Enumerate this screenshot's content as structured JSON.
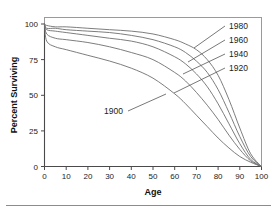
{
  "figure": {
    "background_color": "#ffffff",
    "frame_color": "#9a9a9a",
    "curve_color": "#6e6e6e",
    "axis_color": "#4a4a4a",
    "footer_fragment": ""
  },
  "chart_data": {
    "type": "line",
    "title": "",
    "xlabel": "Age",
    "ylabel": "Percent Surviving",
    "xlim": [
      0,
      100
    ],
    "ylim": [
      0,
      100
    ],
    "xticks": [
      0,
      10,
      20,
      30,
      40,
      50,
      60,
      70,
      80,
      90,
      100
    ],
    "xticklabels": [
      "0",
      "10",
      "20",
      "30",
      "40",
      "50",
      "60",
      "70",
      "80",
      "90",
      "100"
    ],
    "yticks": [
      0,
      25,
      50,
      75,
      100
    ],
    "yticklabels": [
      "0",
      "25",
      "50",
      "75",
      "100"
    ],
    "grid": false,
    "legend_position": "inline-annotations",
    "x": [
      0,
      1,
      5,
      10,
      20,
      30,
      40,
      50,
      60,
      65,
      70,
      75,
      80,
      85,
      90,
      95,
      100
    ],
    "series": [
      {
        "name": "1900",
        "label": "1900",
        "values": [
          100,
          88,
          84,
          82,
          78,
          74,
          69,
          62,
          51,
          44,
          36,
          28,
          20,
          13,
          7,
          3,
          0
        ]
      },
      {
        "name": "1920",
        "label": "1920",
        "values": [
          100,
          93,
          90,
          89,
          87,
          84,
          80,
          75,
          66,
          60,
          52,
          43,
          33,
          22,
          12,
          4,
          0
        ]
      },
      {
        "name": "1940",
        "label": "1940",
        "values": [
          100,
          96,
          95,
          94,
          92,
          90,
          88,
          84,
          77,
          72,
          65,
          56,
          44,
          30,
          16,
          5,
          0
        ]
      },
      {
        "name": "1960",
        "label": "1960",
        "values": [
          100,
          97,
          97,
          96,
          95,
          94,
          92,
          89,
          84,
          80,
          74,
          66,
          54,
          38,
          21,
          7,
          0
        ]
      },
      {
        "name": "1980",
        "label": "1980",
        "values": [
          100,
          99,
          98,
          98,
          97,
          96,
          95,
          93,
          89,
          86,
          82,
          75,
          64,
          47,
          27,
          9,
          0
        ]
      }
    ],
    "annotations": [
      {
        "text": "1980",
        "series": "1980"
      },
      {
        "text": "1960",
        "series": "1960"
      },
      {
        "text": "1940",
        "series": "1940"
      },
      {
        "text": "1920",
        "series": "1920"
      },
      {
        "text": "1900",
        "series": "1900"
      }
    ]
  }
}
